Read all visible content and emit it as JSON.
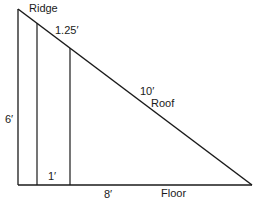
{
  "diagram": {
    "type": "roof cross-section (right triangle)",
    "labels": {
      "ridge": "Ridge",
      "rafter_offset": "1.25′",
      "roof_length": "10′",
      "roof": "Roof",
      "height": "6′",
      "stud_spacing": "1′",
      "floor_length": "8′",
      "floor": "Floor"
    },
    "colors": {
      "line": "#1a1a1a",
      "background": "#ffffff"
    }
  }
}
